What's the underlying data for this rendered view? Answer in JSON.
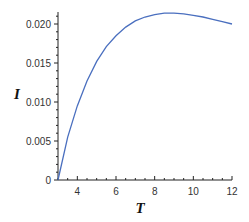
{
  "chart_data": {
    "type": "line",
    "title": "",
    "xlabel": "T",
    "ylabel": "I",
    "xlim": [
      3,
      12
    ],
    "ylim": [
      0,
      0.022
    ],
    "xticks": [
      "4",
      "6",
      "8",
      "10",
      "12"
    ],
    "yticks": [
      "0",
      "0.005",
      "0.010",
      "0.015",
      "0.020"
    ],
    "grid": false,
    "legend": null,
    "series": [
      {
        "name": "I(T)",
        "color": "#4a6fbf",
        "x": [
          3.0,
          3.5,
          4.0,
          4.5,
          5.0,
          5.5,
          6.0,
          6.5,
          7.0,
          7.5,
          8.0,
          8.5,
          9.0,
          9.5,
          10.0,
          10.5,
          11.0,
          11.5,
          12.0
        ],
        "y": [
          0.0,
          0.0055,
          0.0095,
          0.0127,
          0.0152,
          0.0171,
          0.0185,
          0.0196,
          0.0204,
          0.0209,
          0.0212,
          0.0214,
          0.0214,
          0.0213,
          0.0211,
          0.0209,
          0.0206,
          0.0203,
          0.02
        ]
      }
    ]
  }
}
